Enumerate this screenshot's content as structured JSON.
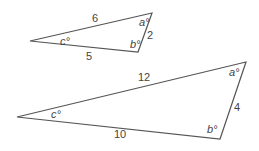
{
  "triangles": [
    {
      "name": "small-triangle",
      "sides": {
        "top": "6",
        "bottom": "5",
        "right": "2"
      },
      "angles": {
        "top_right": "a°",
        "bottom_right": "b°",
        "left": "c°"
      }
    },
    {
      "name": "large-triangle",
      "sides": {
        "top": "12",
        "bottom": "10",
        "right": "4"
      },
      "angles": {
        "top_right": "a°",
        "bottom_right": "b°",
        "left": "c°"
      }
    }
  ],
  "colors": {
    "stroke": "#555555",
    "text": "#444444"
  }
}
